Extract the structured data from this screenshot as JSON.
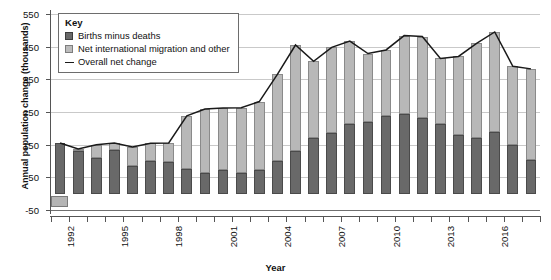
{
  "chart_data": {
    "type": "bar",
    "subtype": "stacked-bar-with-line",
    "title": "",
    "xlabel": "Year",
    "ylabel": "Annual population change (thousands)",
    "ylim": [
      -50,
      550
    ],
    "ytick_values": [
      -50,
      50,
      150,
      250,
      350,
      450,
      550
    ],
    "ytick_labels": [
      "-50",
      "50",
      "150",
      "250",
      "350",
      "450",
      "550"
    ],
    "grid": true,
    "grid_axis": "y",
    "legend_position": "top-left-inside",
    "legend_title": "Key",
    "categories": [
      "1992",
      "1993",
      "1994",
      "1995",
      "1996",
      "1997",
      "1998",
      "1999",
      "2000",
      "2001",
      "2002",
      "2003",
      "2004",
      "2005",
      "2006",
      "2007",
      "2008",
      "2009",
      "2010",
      "2011",
      "2012",
      "2013",
      "2014",
      "2015",
      "2016",
      "2017",
      "2018"
    ],
    "xtick_labels": [
      "1992",
      "",
      "",
      "1995",
      "",
      "",
      "1998",
      "",
      "",
      "2001",
      "",
      "",
      "2004",
      "",
      "",
      "2007",
      "",
      "",
      "2010",
      "",
      "",
      "2013",
      "",
      "",
      "2016",
      "",
      ""
    ],
    "series": [
      {
        "name": "Births minus deaths",
        "color": "#696969",
        "values": [
          155,
          130,
          110,
          133,
          85,
          101,
          98,
          75,
          62,
          72,
          63,
          74,
          100,
          130,
          172,
          186,
          212,
          220,
          239,
          245,
          232,
          212,
          180,
          170,
          190,
          148,
          102
        ]
      },
      {
        "name": "Net international migration and other",
        "color": "#b8b8b8",
        "values": [
          0,
          7,
          40,
          22,
          58,
          53,
          57,
          163,
          197,
          190,
          200,
          208,
          265,
          325,
          233,
          262,
          255,
          209,
          201,
          239,
          249,
          202,
          240,
          290,
          305,
          242,
          280
        ]
      }
    ],
    "line_series": {
      "name": "Overall net change",
      "color": "#1a1a1a",
      "values": [
        155,
        137,
        150,
        155,
        143,
        154,
        155,
        238,
        259,
        262,
        263,
        282,
        365,
        455,
        405,
        448,
        467,
        429,
        440,
        484,
        481,
        414,
        420,
        460,
        495,
        390,
        382
      ]
    }
  },
  "legend": {
    "title": "Key",
    "items": [
      {
        "label": "Births minus deaths",
        "type": "swatch",
        "color": "#696969"
      },
      {
        "label": "Net international migration and other",
        "type": "swatch",
        "color": "#b8b8b8"
      },
      {
        "label": "Overall net change",
        "type": "line",
        "color": "#1a1a1a"
      }
    ]
  },
  "axes": {
    "y_title": "Annual population change (thousands)",
    "x_title": "Year"
  }
}
